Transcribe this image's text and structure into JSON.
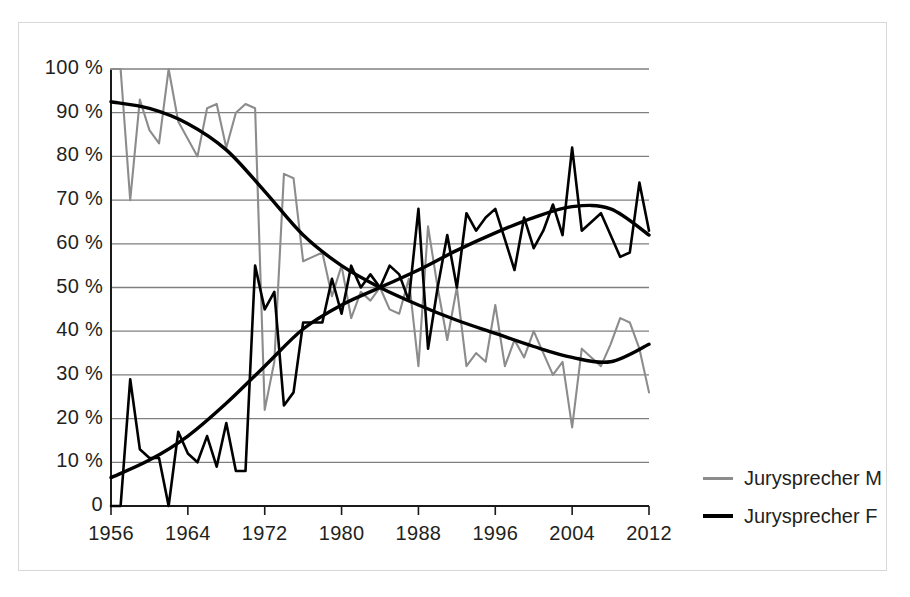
{
  "chart_data": {
    "type": "line",
    "title": "",
    "xlabel": "",
    "ylabel": "",
    "xlim": [
      1956,
      2012
    ],
    "ylim": [
      0,
      100
    ],
    "grid": true,
    "legend_position": "right",
    "x_ticks": [
      "1956",
      "1964",
      "1972",
      "1980",
      "1988",
      "1996",
      "2004",
      "2012"
    ],
    "x_tick_values": [
      1956,
      1964,
      1972,
      1980,
      1988,
      1996,
      2004,
      2012
    ],
    "y_ticks": [
      "0",
      "10 %",
      "20 %",
      "30 %",
      "40 %",
      "50 %",
      "60 %",
      "70 %",
      "80 %",
      "90 %",
      "100 %"
    ],
    "y_tick_values": [
      0,
      10,
      20,
      30,
      40,
      50,
      60,
      70,
      80,
      90,
      100
    ],
    "x": [
      1956,
      1957,
      1958,
      1959,
      1960,
      1961,
      1962,
      1963,
      1964,
      1965,
      1966,
      1967,
      1968,
      1969,
      1970,
      1971,
      1972,
      1973,
      1974,
      1975,
      1976,
      1977,
      1978,
      1979,
      1980,
      1981,
      1982,
      1983,
      1984,
      1985,
      1986,
      1987,
      1988,
      1989,
      1990,
      1991,
      1992,
      1993,
      1994,
      1995,
      1996,
      1997,
      1998,
      1999,
      2000,
      2001,
      2002,
      2003,
      2004,
      2005,
      2006,
      2007,
      2008,
      2009,
      2010,
      2011,
      2012
    ],
    "series": [
      {
        "name": "Jurysprecher M",
        "color": "#8c8c8c",
        "values": [
          100,
          100,
          70,
          93,
          86,
          83,
          100,
          88,
          84,
          80,
          91,
          92,
          82,
          90,
          92,
          91,
          22,
          33,
          76,
          75,
          56,
          57,
          58,
          48,
          55,
          43,
          49,
          47,
          50,
          45,
          44,
          52,
          32,
          64,
          50,
          38,
          50,
          32,
          35,
          33,
          46,
          32,
          38,
          34,
          40,
          35,
          30,
          33,
          18,
          36,
          34,
          32,
          37,
          43,
          42,
          36,
          26
        ]
      },
      {
        "name": "Jurysprecher F",
        "color": "#000000",
        "values": [
          0,
          0,
          29,
          13,
          11,
          11,
          0,
          17,
          12,
          10,
          16,
          9,
          19,
          8,
          8,
          55,
          45,
          49,
          23,
          26,
          42,
          42,
          42,
          52,
          44,
          55,
          50,
          53,
          50,
          55,
          53,
          47,
          68,
          36,
          50,
          62,
          50,
          67,
          63,
          66,
          68,
          61,
          54,
          66,
          59,
          63,
          69,
          62,
          82,
          63,
          65,
          67,
          62,
          57,
          58,
          74,
          63
        ]
      }
    ],
    "trendlines": [
      {
        "name": "Jurysprecher M trend",
        "color": "#000000",
        "points": [
          [
            1956,
            92.5
          ],
          [
            1960,
            91.0
          ],
          [
            1964,
            87.5
          ],
          [
            1968,
            81.5
          ],
          [
            1972,
            72.0
          ],
          [
            1976,
            62.0
          ],
          [
            1980,
            55.0
          ],
          [
            1984,
            50.0
          ],
          [
            1988,
            46.0
          ],
          [
            1992,
            42.5
          ],
          [
            1996,
            39.5
          ],
          [
            2000,
            36.5
          ],
          [
            2004,
            34.0
          ],
          [
            2008,
            33.0
          ],
          [
            2012,
            37.0
          ]
        ]
      },
      {
        "name": "Jurysprecher F trend",
        "color": "#000000",
        "points": [
          [
            1956,
            6.5
          ],
          [
            1960,
            10.5
          ],
          [
            1964,
            16.0
          ],
          [
            1968,
            23.5
          ],
          [
            1972,
            32.0
          ],
          [
            1976,
            40.5
          ],
          [
            1980,
            46.0
          ],
          [
            1984,
            50.0
          ],
          [
            1988,
            54.0
          ],
          [
            1992,
            58.5
          ],
          [
            1996,
            62.5
          ],
          [
            2000,
            66.0
          ],
          [
            2004,
            68.5
          ],
          [
            2008,
            68.0
          ],
          [
            2012,
            62.0
          ]
        ]
      }
    ]
  },
  "legend": {
    "items": [
      {
        "label": "Jurysprecher M",
        "color": "#8c8c8c"
      },
      {
        "label": "Jurysprecher F",
        "color": "#000000"
      }
    ]
  },
  "colors": {
    "series_m": "#8c8c8c",
    "series_f": "#000000",
    "gridline": "#7f7f7f",
    "axis": "#1a1a1a",
    "frame": "#d8d8d8",
    "text": "#231f20",
    "background": "#ffffff"
  }
}
